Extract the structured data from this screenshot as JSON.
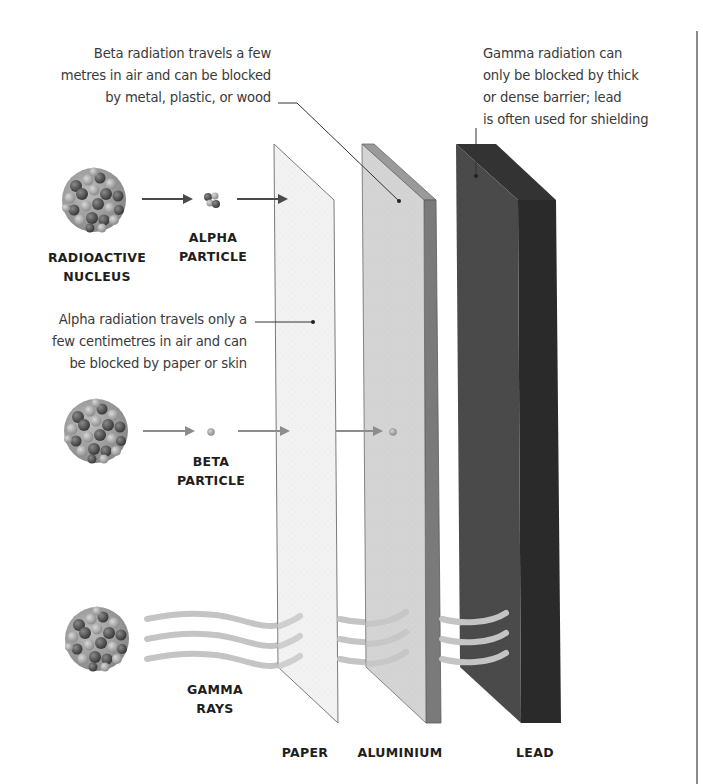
{
  "annotations": {
    "beta": [
      "Beta radiation travels a few",
      "metres in air and can be blocked",
      "by metal, plastic, or wood"
    ],
    "gamma": [
      "Gamma radiation can",
      "only be blocked by thick",
      "or dense barrier; lead",
      "is often used for shielding"
    ],
    "alpha": [
      "Alpha radiation travels only a",
      "few centimetres in air and can",
      "be blocked by paper or skin"
    ]
  },
  "labels": {
    "nucleus": [
      "RADIOACTIVE",
      "NUCLEUS"
    ],
    "alpha_particle": [
      "ALPHA",
      "PARTICLE"
    ],
    "beta_particle": [
      "BETA",
      "PARTICLE"
    ],
    "gamma_rays": [
      "GAMMA",
      "RAYS"
    ]
  },
  "barriers": [
    {
      "name": "PAPER",
      "front_color": "#f1f1f1",
      "side_color": "#dcdcdc",
      "blocks": "alpha"
    },
    {
      "name": "ALUMINIUM",
      "front_color": "#d4d4d4",
      "side_color": "#7a7a7a",
      "top_color": "#9a9a9a",
      "blocks": "beta"
    },
    {
      "name": "LEAD",
      "front_color": "#474747",
      "side_color": "#2a2a2a",
      "top_color": "#333333",
      "blocks": "gamma"
    }
  ],
  "colors": {
    "arrow": "#5a5a5a",
    "beta_arrow": "#8c8c8c",
    "gamma_wave": "#c4c4c4",
    "leader_line": "#333333",
    "divider": "#8a8a8a"
  }
}
